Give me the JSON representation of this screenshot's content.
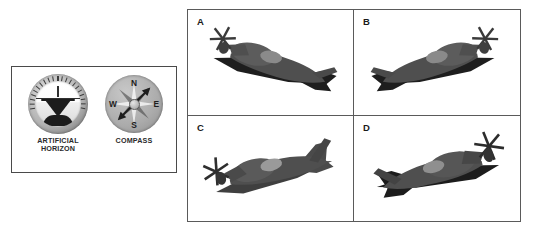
{
  "instrument_panel": {
    "name": "flight-instrument-panel",
    "instruments": [
      {
        "id": "artificial-horizon",
        "label_line1": "ARTIFICIAL",
        "label_line2": "HORIZON",
        "icon": "artificial-horizon-dial-icon",
        "bezel_color": "#b3b3b3",
        "face_color": "#ffffff",
        "aircraft_symbol_color": "#1c1c1c",
        "tick_count": 21,
        "bank_angle_deg": 0,
        "pitch": "level"
      },
      {
        "id": "compass",
        "label_line1": "COMPASS",
        "label_line2": "",
        "icon": "compass-rose-icon",
        "body_color": "#ababab",
        "needle_color": "#1e1e1e",
        "needle_heading_deg": 45,
        "cardinals": {
          "north": "N",
          "east": "E",
          "south": "S",
          "west": "W"
        }
      }
    ]
  },
  "options_grid": {
    "name": "aircraft-orientation-options",
    "columns": 2,
    "rows": 2,
    "border_color": "#5a5a5a",
    "background": "#ffffff",
    "options": [
      {
        "letter": "A",
        "icon": "aircraft-silhouette-icon",
        "body_color": "#4f4f4f",
        "shadow_color": "#1e1e1e",
        "nose_direction": "left",
        "bank": "banked-left-descending",
        "description": "Propeller aircraft viewed from above-front, nose toward lower left, wings angled."
      },
      {
        "letter": "B",
        "icon": "aircraft-silhouette-icon",
        "body_color": "#4f4f4f",
        "shadow_color": "#1e1e1e",
        "nose_direction": "right",
        "bank": "banked-right-descending",
        "description": "Propeller aircraft with nose toward lower right, tail upper left."
      },
      {
        "letter": "C",
        "icon": "aircraft-silhouette-icon",
        "body_color": "#4f4f4f",
        "shadow_color": "#1e1e1e",
        "nose_direction": "left",
        "bank": "climbing-left",
        "description": "Propeller aircraft with nose toward lower left, tail upper right."
      },
      {
        "letter": "D",
        "icon": "aircraft-silhouette-icon",
        "body_color": "#4f4f4f",
        "shadow_color": "#1e1e1e",
        "nose_direction": "right",
        "bank": "banked-right",
        "description": "Propeller aircraft with nose toward upper right, tail lower left."
      }
    ]
  }
}
